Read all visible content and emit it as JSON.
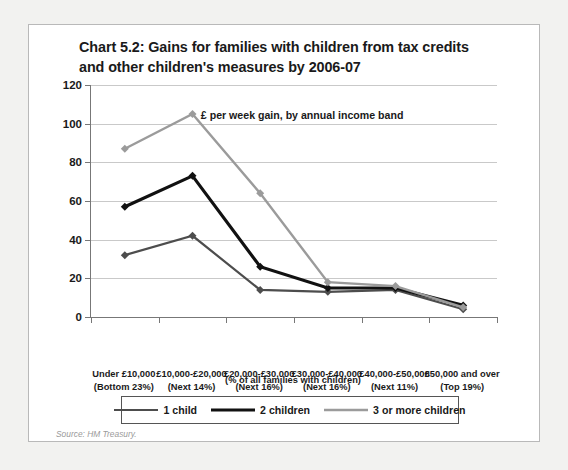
{
  "chart_data": {
    "type": "line",
    "title": "Chart 5.2: Gains for families with children from tax credits and other children's measures by 2006-07",
    "title_lines": [
      "Chart 5.2: Gains for families with children from tax credits",
      "and other children's measures by 2006-07"
    ],
    "annotation": "£ per week gain, by annual income band",
    "xlabel": "(% of all families with children)",
    "ylabel": "",
    "ylim": [
      0,
      120
    ],
    "ytick_step": 20,
    "yticks": [
      0,
      20,
      40,
      60,
      80,
      100,
      120
    ],
    "ytick_labels": [
      "0",
      "20",
      "40",
      "60",
      "80",
      "100",
      "120"
    ],
    "grid": true,
    "legend_position": "bottom",
    "source": "Source: HM Treasury.",
    "categories": [
      "Under £10,000 (Bottom 23%)",
      "£10,000-£20,000 (Next 14%)",
      "£20,000-£30,000 (Next 16%)",
      "£30,000-£40,000 (Next 16%)",
      "£40,000-£50,000 (Next 11%)",
      "£50,000 and over (Top 19%)"
    ],
    "category_lines": [
      {
        "line1": "Under £10,000",
        "line2": "(Bottom 23%)"
      },
      {
        "line1": "£10,000-£20,000",
        "line2": "(Next 14%)"
      },
      {
        "line1": "£20,000-£30,000",
        "line2": "(Next 16%)"
      },
      {
        "line1": "£30,000-£40,000",
        "line2": "(Next 16%)"
      },
      {
        "line1": "£40,000-£50,000",
        "line2": "(Next 11%)"
      },
      {
        "line1": "£50,000 and over",
        "line2": "(Top 19%)"
      }
    ],
    "series": [
      {
        "name": "1 child",
        "color": "#4d4d4d",
        "width": 2.2,
        "values": [
          32,
          42,
          14,
          13,
          14,
          4
        ]
      },
      {
        "name": "2 children",
        "color": "#111111",
        "width": 3.2,
        "values": [
          57,
          73,
          26,
          15,
          15,
          6
        ]
      },
      {
        "name": "3 or more children",
        "color": "#9b9b9b",
        "width": 2.4,
        "values": [
          87,
          105,
          64,
          18,
          16,
          5
        ]
      }
    ]
  }
}
